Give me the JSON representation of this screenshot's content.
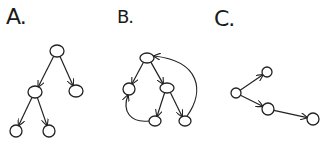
{
  "panels": [
    {
      "label": "A.",
      "label_pos": [
        6,
        6
      ],
      "description": "tree",
      "nodes": [
        {
          "id": "a0",
          "x": 57,
          "y": 51,
          "rx": 7,
          "ry": 6
        },
        {
          "id": "a1",
          "x": 35,
          "y": 92,
          "rx": 7,
          "ry": 6
        },
        {
          "id": "a2",
          "x": 76,
          "y": 91,
          "rx": 7,
          "ry": 6
        },
        {
          "id": "a3",
          "x": 16,
          "y": 131,
          "rx": 6,
          "ry": 6
        },
        {
          "id": "a4",
          "x": 49,
          "y": 131,
          "rx": 6,
          "ry": 6
        }
      ],
      "edges": [
        {
          "from": "a0",
          "to": "a1"
        },
        {
          "from": "a0",
          "to": "a2"
        },
        {
          "from": "a1",
          "to": "a3"
        },
        {
          "from": "a1",
          "to": "a4"
        }
      ]
    },
    {
      "label": "B.",
      "label_pos": [
        117,
        8
      ],
      "description": "cyclic directed graph",
      "nodes": [
        {
          "id": "b0",
          "x": 147,
          "y": 58,
          "rx": 7,
          "ry": 5
        },
        {
          "id": "b1",
          "x": 129,
          "y": 89,
          "rx": 6,
          "ry": 6
        },
        {
          "id": "b2",
          "x": 167,
          "y": 88,
          "rx": 7,
          "ry": 5
        },
        {
          "id": "b3",
          "x": 155,
          "y": 121,
          "rx": 6,
          "ry": 5
        },
        {
          "id": "b4",
          "x": 185,
          "y": 121,
          "rx": 6,
          "ry": 5
        }
      ],
      "edges": [
        {
          "from": "b0",
          "to": "b1"
        },
        {
          "from": "b0",
          "to": "b2"
        },
        {
          "from": "b2",
          "to": "b3"
        },
        {
          "from": "b2",
          "to": "b4"
        },
        {
          "from": "b3",
          "to": "b1",
          "curved": true
        },
        {
          "from": "b4",
          "to": "b0",
          "curved": true
        }
      ]
    },
    {
      "label": "C.",
      "label_pos": [
        214,
        8
      ],
      "description": "forest / small tree",
      "nodes": [
        {
          "id": "c0",
          "x": 236,
          "y": 93,
          "rx": 5,
          "ry": 5
        },
        {
          "id": "c1",
          "x": 267,
          "y": 72,
          "rx": 5,
          "ry": 5
        },
        {
          "id": "c2",
          "x": 268,
          "y": 109,
          "rx": 6,
          "ry": 6
        },
        {
          "id": "c3",
          "x": 313,
          "y": 119,
          "rx": 6,
          "ry": 6
        }
      ],
      "edges": [
        {
          "from": "c0",
          "to": "c1"
        },
        {
          "from": "c0",
          "to": "c2"
        },
        {
          "from": "c2",
          "to": "c3"
        }
      ]
    }
  ]
}
